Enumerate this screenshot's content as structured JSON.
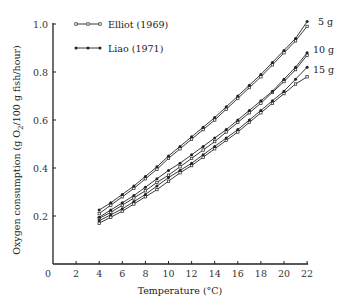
{
  "chart_data": {
    "type": "line",
    "title": "",
    "xlabel": "Temperature (°C)",
    "ylabel": "Oxygen consumption (g O2/100 g fish/hour)",
    "xlim": [
      0,
      22
    ],
    "ylim": [
      0,
      1.0
    ],
    "xticks": [
      0,
      2,
      4,
      6,
      8,
      10,
      12,
      14,
      16,
      18,
      20,
      22
    ],
    "yticks": [
      0.2,
      0.4,
      0.6,
      0.8,
      1.0
    ],
    "ytick_labels": [
      "0.2",
      "0.4",
      "0.6",
      "0.8",
      "1.0"
    ],
    "grid": false,
    "legend_position": "top-left",
    "legend": [
      {
        "name": "Elliot (1969)",
        "marker": "small-tick"
      },
      {
        "name": "Liao (1971)",
        "marker": "dot"
      }
    ],
    "annotations": [
      "5 g",
      "10 g",
      "15 g"
    ],
    "x": [
      4,
      5,
      6,
      7,
      8,
      9,
      10,
      11,
      12,
      13,
      14,
      15,
      16,
      17,
      18,
      19,
      20,
      21,
      22
    ],
    "series": [
      {
        "name": "Elliot (1969) 5 g",
        "group": "5 g",
        "source": "Elliot (1969)",
        "values": [
          0.21,
          0.245,
          0.28,
          0.315,
          0.355,
          0.395,
          0.44,
          0.48,
          0.52,
          0.56,
          0.6,
          0.645,
          0.69,
          0.735,
          0.78,
          0.83,
          0.88,
          0.93,
          0.99
        ]
      },
      {
        "name": "Liao (1971) 5 g",
        "group": "5 g",
        "source": "Liao (1971)",
        "values": [
          0.225,
          0.255,
          0.29,
          0.325,
          0.365,
          0.405,
          0.45,
          0.49,
          0.53,
          0.57,
          0.61,
          0.655,
          0.7,
          0.745,
          0.79,
          0.84,
          0.89,
          0.94,
          1.01
        ]
      },
      {
        "name": "Elliot (1969) 10 g",
        "group": "10 g",
        "source": "Elliot (1969)",
        "values": [
          0.19,
          0.215,
          0.245,
          0.275,
          0.305,
          0.34,
          0.37,
          0.405,
          0.44,
          0.475,
          0.51,
          0.55,
          0.59,
          0.63,
          0.67,
          0.715,
          0.76,
          0.81,
          0.87
        ]
      },
      {
        "name": "Liao (1971) 10 g",
        "group": "10 g",
        "source": "Liao (1971)",
        "values": [
          0.195,
          0.225,
          0.255,
          0.285,
          0.32,
          0.355,
          0.39,
          0.42,
          0.455,
          0.49,
          0.525,
          0.56,
          0.6,
          0.64,
          0.68,
          0.72,
          0.77,
          0.82,
          0.88
        ]
      },
      {
        "name": "Elliot (1969) 15 g",
        "group": "15 g",
        "source": "Elliot (1969)",
        "values": [
          0.17,
          0.195,
          0.22,
          0.25,
          0.28,
          0.31,
          0.345,
          0.38,
          0.41,
          0.445,
          0.48,
          0.515,
          0.55,
          0.59,
          0.63,
          0.67,
          0.71,
          0.75,
          0.78
        ]
      },
      {
        "name": "Liao (1971) 15 g",
        "group": "15 g",
        "source": "Liao (1971)",
        "values": [
          0.18,
          0.205,
          0.23,
          0.26,
          0.29,
          0.325,
          0.36,
          0.39,
          0.42,
          0.455,
          0.49,
          0.525,
          0.56,
          0.6,
          0.64,
          0.68,
          0.72,
          0.77,
          0.82
        ]
      }
    ]
  }
}
